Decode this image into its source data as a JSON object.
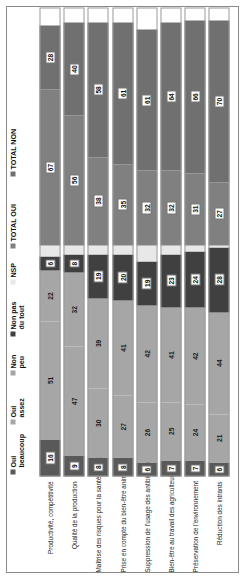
{
  "chart_data": {
    "type": "bar",
    "orientation": "horizontal-stacked",
    "title": "",
    "xlabel": "",
    "ylabel": "",
    "grid": false,
    "legend_position": "top",
    "categories": [
      "Productivité, compétitivité",
      "Qualité de la production",
      "Maîtrise des risques pour la santé des consommateurs",
      "Prise en compte du bien-être animal",
      "Suppression de l'usage des antibiotiques en élevage",
      "Bien-être au travail des agriculteurs",
      "Préservation de l'environnement",
      "Réduction des intrants"
    ],
    "series": [
      {
        "name": "Oui beaucoup",
        "color": "#595959",
        "values": [
          16,
          9,
          8,
          8,
          6,
          7,
          7,
          6
        ]
      },
      {
        "name": "Oui assez",
        "color": "#a6a6a6",
        "values": [
          51,
          47,
          30,
          27,
          26,
          25,
          24,
          21
        ]
      },
      {
        "name": "Non peu",
        "color": "#a6a6a6",
        "values": [
          22,
          32,
          39,
          41,
          42,
          41,
          42,
          44
        ]
      },
      {
        "name": "Non pas du tout",
        "color": "#404040",
        "values": [
          6,
          8,
          19,
          20,
          19,
          23,
          24,
          28
        ]
      },
      {
        "name": "NSP",
        "color": "#e8e8e8",
        "values": [
          5,
          4,
          4,
          4,
          7,
          4,
          3,
          1
        ]
      },
      {
        "name": "TOTAL OUI",
        "color": "#808080",
        "values": [
          67,
          56,
          38,
          35,
          32,
          32,
          31,
          27
        ]
      },
      {
        "name": "TOTAL NON",
        "color": "#707070",
        "values": [
          28,
          40,
          58,
          61,
          61,
          64,
          66,
          70
        ]
      }
    ],
    "legend": [
      "Oui\nbeaucoup",
      "Oui\nassez",
      "Non\npeu",
      "Non pas\ndu tout",
      "NSP",
      "TOTAL OUI",
      "TOTAL NON"
    ]
  }
}
